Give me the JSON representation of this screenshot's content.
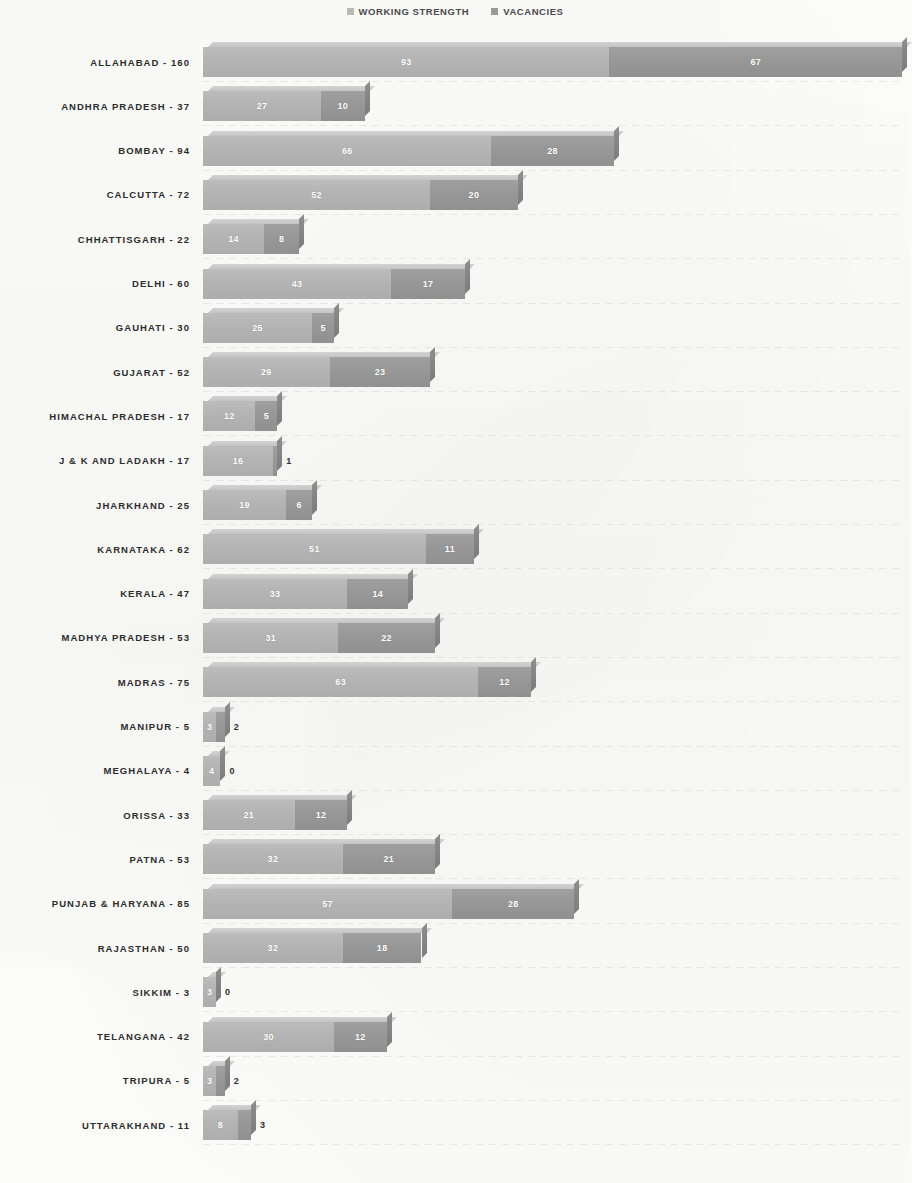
{
  "legend": {
    "items": [
      {
        "label": "WORKING STRENGTH",
        "color": "#b4b4b4",
        "swatch_icon": "square-marker-icon"
      },
      {
        "label": "VACANCIES",
        "color": "#989898",
        "swatch_icon": "square-marker-icon"
      }
    ]
  },
  "axis": {
    "label_separator": "-",
    "bar_start_px": 203,
    "px_per_unit": 4.37
  },
  "chart_data": {
    "type": "bar",
    "orientation": "horizontal",
    "stacked": true,
    "title": "",
    "subtitle": "",
    "xlabel": "",
    "ylabel": "",
    "grid": true,
    "legend_position": "top-center",
    "xlim": [
      0,
      160
    ],
    "categories": [
      "ALLAHABAD",
      "ANDHRA PRADESH",
      "BOMBAY",
      "CALCUTTA",
      "CHHATTISGARH",
      "DELHI",
      "GAUHATI",
      "GUJARAT",
      "HIMACHAL PRADESH",
      "J & K AND LADAKH",
      "JHARKHAND",
      "KARNATAKA",
      "KERALA",
      "MADHYA PRADESH",
      "MADRAS",
      "MANIPUR",
      "MEGHALAYA",
      "ORISSA",
      "PATNA",
      "PUNJAB & HARYANA",
      "RAJASTHAN",
      "SIKKIM",
      "TELANGANA",
      "TRIPURA",
      "UTTARAKHAND"
    ],
    "totals": [
      160,
      37,
      94,
      72,
      22,
      60,
      30,
      52,
      17,
      17,
      25,
      62,
      47,
      53,
      75,
      5,
      4,
      33,
      53,
      85,
      50,
      3,
      42,
      5,
      11
    ],
    "series": [
      {
        "name": "WORKING STRENGTH",
        "values": [
          93,
          27,
          66,
          52,
          14,
          43,
          25,
          29,
          12,
          16,
          19,
          51,
          33,
          31,
          63,
          3,
          4,
          21,
          32,
          57,
          32,
          3,
          30,
          3,
          8
        ]
      },
      {
        "name": "VACANCIES",
        "values": [
          67,
          10,
          28,
          20,
          8,
          17,
          5,
          23,
          5,
          1,
          6,
          11,
          14,
          22,
          12,
          2,
          0,
          12,
          21,
          28,
          18,
          0,
          12,
          2,
          3
        ]
      }
    ]
  }
}
